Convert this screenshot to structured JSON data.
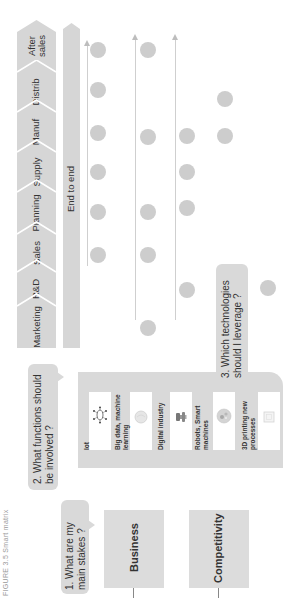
{
  "caption": "FIGURE 3.5 Smart matrix",
  "functions": {
    "segments": [
      {
        "label": "After sales"
      },
      {
        "label": "Distrib"
      },
      {
        "label": "Manuf"
      },
      {
        "label": "Supply"
      },
      {
        "label": "Planning"
      },
      {
        "label": "Sales"
      },
      {
        "label": "R&D"
      },
      {
        "label": "Marketing"
      }
    ],
    "end_to_end_label": "End to end",
    "fill_color": "#d6d6d6"
  },
  "questions": {
    "q1": "1. What are my main stakes ?",
    "q2": "2. What functions should be involved ?",
    "q3": "3. Which technologies should I leverage ?"
  },
  "stakes": [
    {
      "label": "Business"
    },
    {
      "label": "Competitivity"
    }
  ],
  "technologies": [
    {
      "label": "Iot",
      "icon": "network-node-icon"
    },
    {
      "label": "Big data, machine learning",
      "icon": "globe-icon"
    },
    {
      "label": "Digital industry",
      "icon": "robot-arm-icon"
    },
    {
      "label": "Robots, Smart machines",
      "icon": "gear-cluster-icon"
    },
    {
      "label": "3D printing new processes",
      "icon": "printer-cube-icon"
    }
  ],
  "matrix": {
    "dot_color": "#cdcdcd",
    "columns": [
      {
        "x": 98,
        "dots_y": [
          50,
          90,
          133,
          172,
          212,
          255
        ]
      },
      {
        "x": 148,
        "dots_y": [
          50,
          137,
          212,
          255,
          328
        ]
      },
      {
        "x": 187,
        "dots_y": [
          136,
          172,
          208,
          290
        ]
      },
      {
        "x": 225,
        "dots_y": [
          99,
          136
        ]
      },
      {
        "x": 268,
        "dots_y": [
          288
        ]
      }
    ]
  }
}
